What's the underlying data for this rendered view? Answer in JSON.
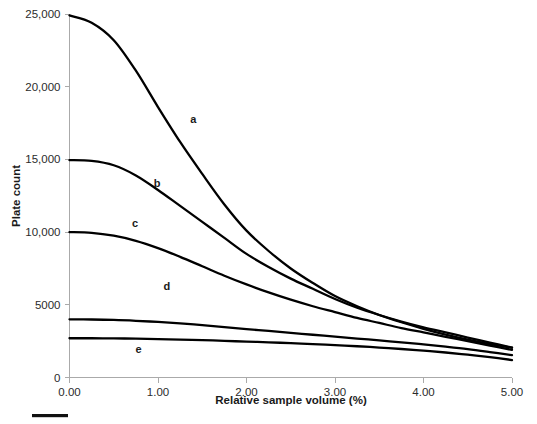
{
  "chart_data": {
    "type": "line",
    "title": "",
    "xlabel": "Relative sample volume (%)",
    "ylabel": "Plate count",
    "xlim": [
      0,
      5
    ],
    "ylim": [
      0,
      25000
    ],
    "grid": false,
    "legend_position": "inline-labels",
    "x_ticks": [
      "0.00",
      "1.00",
      "2.00",
      "3.00",
      "4.00",
      "5.00"
    ],
    "x_tick_values": [
      0,
      1,
      2,
      3,
      4,
      5
    ],
    "y_ticks": [
      "0",
      "5000",
      "10,000",
      "15,000",
      "20,000",
      "25,000"
    ],
    "y_tick_values": [
      0,
      5000,
      10000,
      15000,
      20000,
      25000
    ],
    "x": [
      0,
      0.25,
      0.5,
      0.75,
      1,
      1.25,
      1.5,
      1.75,
      2,
      2.25,
      2.5,
      2.75,
      3,
      3.25,
      3.5,
      3.75,
      4,
      4.25,
      4.5,
      4.75,
      5
    ],
    "series": [
      {
        "name": "a",
        "label": "a",
        "label_x": 1.4,
        "label_y": 17800,
        "color": "#000000",
        "values": [
          24900,
          24400,
          23200,
          21100,
          18600,
          16200,
          14000,
          11900,
          10100,
          8700,
          7500,
          6500,
          5600,
          4900,
          4300,
          3800,
          3350,
          2950,
          2600,
          2300,
          2050
        ]
      },
      {
        "name": "b",
        "label": "b",
        "label_x": 0.99,
        "label_y": 13400,
        "color": "#000000",
        "values": [
          14950,
          14900,
          14600,
          13900,
          12900,
          11800,
          10700,
          9600,
          8500,
          7600,
          6800,
          6100,
          5400,
          4800,
          4300,
          3850,
          3450,
          3100,
          2750,
          2400,
          2050
        ]
      },
      {
        "name": "c",
        "label": "c",
        "label_x": 0.74,
        "label_y": 10600,
        "color": "#000000",
        "values": [
          10000,
          9950,
          9750,
          9400,
          8900,
          8300,
          7650,
          7000,
          6400,
          5850,
          5350,
          4900,
          4500,
          4100,
          3750,
          3400,
          3100,
          2800,
          2500,
          2200,
          1900
        ]
      },
      {
        "name": "d",
        "label": "d",
        "label_x": 1.1,
        "label_y": 6300,
        "color": "#000000",
        "values": [
          4000,
          3990,
          3960,
          3900,
          3820,
          3720,
          3600,
          3470,
          3330,
          3200,
          3070,
          2940,
          2810,
          2680,
          2550,
          2420,
          2280,
          2120,
          1950,
          1750,
          1540
        ]
      },
      {
        "name": "e",
        "label": "e",
        "label_x": 0.78,
        "label_y": 1950,
        "color": "#000000",
        "values": [
          2700,
          2700,
          2690,
          2670,
          2640,
          2610,
          2570,
          2520,
          2470,
          2420,
          2360,
          2300,
          2230,
          2150,
          2060,
          1960,
          1850,
          1720,
          1570,
          1400,
          1200
        ]
      }
    ]
  },
  "figure": {
    "footer_rule_visible": true
  }
}
